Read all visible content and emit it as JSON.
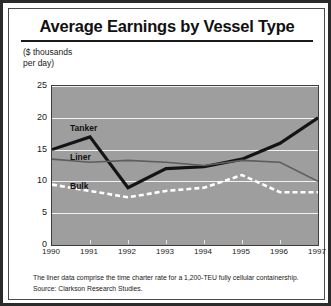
{
  "title": "Average Earnings by Vessel Type",
  "y_axis_caption": "($ thousands\nper day)",
  "footnotes": {
    "note": "The liner data comprise the time charter rate for a 1,200-TEU fully cellular containership.",
    "source": "Source: Clarkson Research Studies."
  },
  "series_labels": {
    "tanker": "Tanker",
    "liner": "Liner",
    "bulk": "Bulk"
  },
  "colors": {
    "plot_background": "#9e9e9e",
    "gridline": "#f2f2f2",
    "tanker": "#141414",
    "liner": "#5d5d5d",
    "bulk": "#ffffff",
    "frame": "#2b2b2b"
  },
  "chart_data": {
    "type": "line",
    "title": "Average Earnings by Vessel Type",
    "xlabel": "",
    "ylabel": "($ thousands per day)",
    "x": [
      1990,
      1991,
      1992,
      1993,
      1994,
      1995,
      1996,
      1997
    ],
    "xtick_labels": [
      "1990",
      "1991",
      "1992",
      "1993",
      "1994",
      "1995",
      "1996",
      "1997"
    ],
    "ytick_labels": [
      "0",
      "5",
      "10",
      "15",
      "20",
      "25"
    ],
    "yticks": [
      0,
      5,
      10,
      15,
      20,
      25
    ],
    "ylim": [
      0,
      25
    ],
    "xlim": [
      1990,
      1997
    ],
    "grid": true,
    "legend_position": "inline-labels",
    "series": [
      {
        "name": "Tanker",
        "style": "solid-thick-black",
        "values": [
          15.0,
          17.0,
          9.0,
          12.0,
          12.3,
          13.5,
          16.0,
          20.0
        ]
      },
      {
        "name": "Liner",
        "style": "solid-thin-gray",
        "values": [
          13.5,
          13.0,
          13.3,
          13.0,
          12.5,
          13.3,
          13.0,
          10.0
        ]
      },
      {
        "name": "Bulk",
        "style": "dashed-white",
        "values": [
          9.5,
          8.5,
          7.5,
          8.5,
          9.0,
          11.0,
          8.3,
          8.3
        ]
      }
    ]
  }
}
